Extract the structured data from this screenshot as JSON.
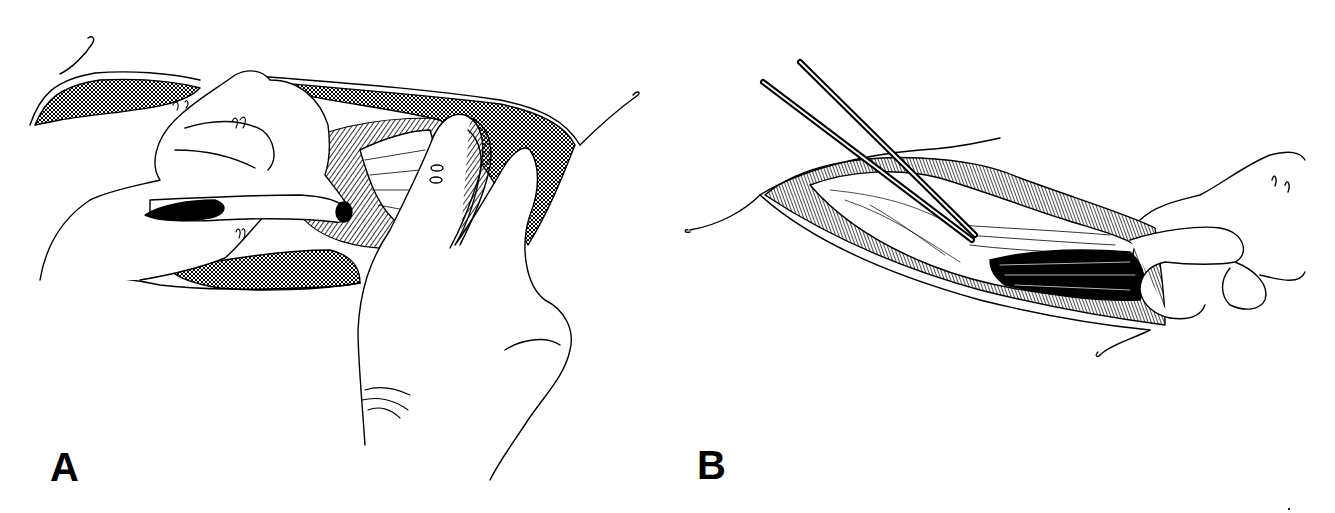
{
  "figure": {
    "panels": [
      {
        "label": "A",
        "depiction": "surgical-incision-with-gloved-hands-retracting-tissue",
        "line_color": "#000000",
        "background": "#ffffff"
      },
      {
        "label": "B",
        "depiction": "surgical-incision-with-forceps-and-hand-holding-tissue",
        "line_color": "#000000",
        "background": "#ffffff"
      }
    ]
  }
}
